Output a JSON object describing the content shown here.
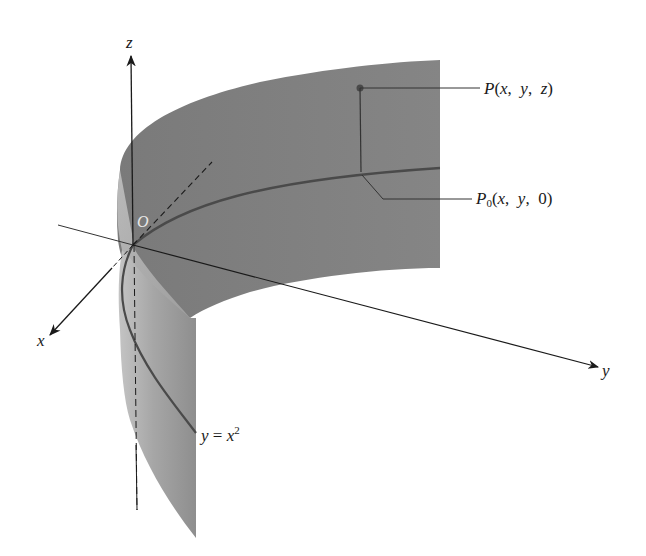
{
  "figure": {
    "axes": {
      "x_label": "x",
      "y_label": "y",
      "z_label": "z",
      "origin_label": "O"
    },
    "curve_label": {
      "lhs": "y",
      "eq": " = ",
      "var": "x",
      "exp": "2"
    },
    "point_P": {
      "name": "P",
      "open": "(",
      "args": [
        "x",
        "y",
        "z"
      ],
      "close": ")"
    },
    "point_P0": {
      "name": "P",
      "sub": "0",
      "open": "(",
      "args": [
        "x",
        "y",
        "0"
      ],
      "close": ")"
    },
    "colors": {
      "surface_back": "#7d7d7d",
      "surface_front": "#9a9a9a",
      "surface_highlight": "#bdbdbd",
      "curve": "#4a4a4a",
      "axis": "#1a1a1a",
      "background": "#ffffff"
    }
  }
}
